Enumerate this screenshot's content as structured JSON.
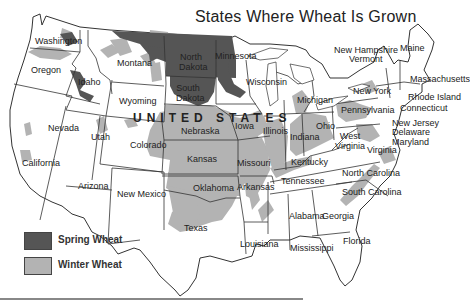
{
  "title": "States Where Wheat Is Grown",
  "colors": {
    "spring_wheat": "#555555",
    "winter_wheat": "#b3b3b3",
    "state_fill": "#ffffff",
    "border": "#333333"
  },
  "country_label": "UNITED STATES",
  "legend": [
    {
      "label": "Spring Wheat",
      "color": "#555555"
    },
    {
      "label": "Winter Wheat",
      "color": "#b3b3b3"
    }
  ],
  "states": {
    "washington": "Washington",
    "oregon": "Oregon",
    "idaho": "Idaho",
    "montana": "Montana",
    "wyoming": "Wyoming",
    "north_dakota": "North Dakota",
    "south_dakota": "South Dakota",
    "minnesota": "Minnesota",
    "wisconsin": "Wisconsin",
    "michigan": "Michigan",
    "nevada": "Nevada",
    "utah": "Utah",
    "colorado": "Colorado",
    "nebraska": "Nebraska",
    "iowa": "Iowa",
    "illinois": "Illinois",
    "indiana": "Indiana",
    "ohio": "Ohio",
    "california": "California",
    "arizona": "Arizona",
    "new_mexico": "New Mexico",
    "kansas": "Kansas",
    "oklahoma": "Oklahoma",
    "texas": "Texas",
    "missouri": "Missouri",
    "arkansas": "Arkansas",
    "louisiana": "Louisiana",
    "mississippi": "Mississippi",
    "alabama": "Alabama",
    "georgia": "Georgia",
    "florida": "Florida",
    "tennessee": "Tennessee",
    "kentucky": "Kentucky",
    "west_virginia": "West Virginia",
    "virginia": "Virginia",
    "north_carolina": "North Carolina",
    "south_carolina": "South Carolina",
    "pennsylvania": "Pennsylvania",
    "new_york": "New York",
    "new_jersey": "New Jersey",
    "delaware": "Delaware",
    "maryland": "Maryland",
    "connecticut": "Connecticut",
    "rhode_island": "Rhode Island",
    "massachusetts": "Massachusetts",
    "vermont": "Vermont",
    "new_hampshire": "New Hampshire",
    "maine": "Maine"
  },
  "spring_wheat_states": [
    "North Dakota",
    "South Dakota",
    "Minnesota",
    "Montana",
    "Idaho",
    "Washington"
  ],
  "winter_wheat_states": [
    "Kansas",
    "Oklahoma",
    "Texas",
    "Nebraska",
    "Colorado",
    "Missouri",
    "Illinois",
    "Indiana",
    "Ohio",
    "Michigan",
    "Kentucky",
    "Arkansas",
    "Tennessee",
    "Pennsylvania",
    "New York",
    "Maryland",
    "Virginia",
    "North Carolina",
    "South Carolina",
    "Georgia",
    "Washington",
    "Oregon",
    "Idaho",
    "Montana",
    "California",
    "Utah",
    "Wyoming",
    "South Dakota"
  ]
}
